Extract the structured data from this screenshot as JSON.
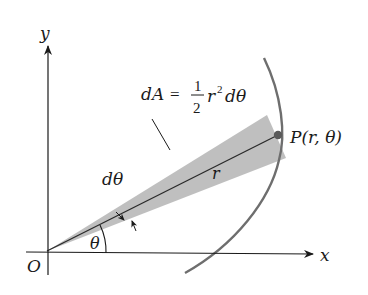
{
  "diagram": {
    "axes": {
      "x_label": "x",
      "y_label": "y",
      "origin_label": "O"
    },
    "formula": {
      "lhs": "dA",
      "eq": "=",
      "frac_num": "1",
      "frac_den": "2",
      "r": "r",
      "exp": "2",
      "tail": "dθ"
    },
    "labels": {
      "point": "P(r, θ)",
      "radius": "r",
      "angle": "θ",
      "dtheta": "dθ"
    },
    "colors": {
      "wedge": "#b8b8b8",
      "curve": "#6e6e6e",
      "axis": "#1a1a1a",
      "point": "#5a5a5a"
    }
  }
}
